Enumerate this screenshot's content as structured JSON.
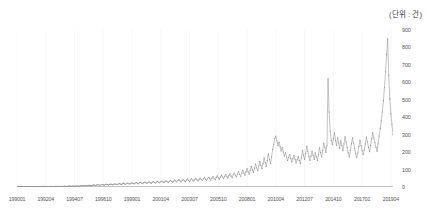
{
  "unit_label": "(단위 : 건)",
  "colors": {
    "line": "#9a9a9a",
    "marker": "#8c8c8c",
    "axis": "#888888",
    "grid": "#f0f0f0",
    "text": "#555555"
  },
  "chart_data": {
    "type": "line",
    "title": "",
    "subtitle": "",
    "xlabel": "",
    "ylabel": "",
    "unit": "(단위 : 건)",
    "ylim": [
      0,
      900
    ],
    "grid": "vertical-only",
    "legend": "none",
    "y_ticks": [
      0,
      100,
      200,
      300,
      400,
      500,
      600,
      700,
      800,
      900
    ],
    "x_tick_labels": [
      "199001",
      "199204",
      "199407",
      "199610",
      "199901",
      "200104",
      "200307",
      "200510",
      "200801",
      "201004",
      "201207",
      "201410",
      "201701",
      "201904"
    ],
    "x_tick_indices": [
      0,
      27,
      54,
      81,
      108,
      135,
      162,
      189,
      216,
      243,
      270,
      297,
      324,
      351
    ],
    "x_label": "Monthly period (YYYYMM)",
    "n_points": 366,
    "values": [
      2,
      2,
      1,
      3,
      2,
      2,
      1,
      2,
      3,
      2,
      2,
      1,
      2,
      3,
      2,
      2,
      3,
      2,
      1,
      2,
      2,
      3,
      2,
      2,
      3,
      4,
      3,
      2,
      3,
      3,
      2,
      3,
      4,
      3,
      2,
      3,
      4,
      3,
      4,
      3,
      2,
      3,
      4,
      3,
      4,
      5,
      4,
      3,
      5,
      6,
      5,
      4,
      6,
      5,
      4,
      6,
      7,
      6,
      5,
      6,
      8,
      7,
      6,
      8,
      9,
      8,
      7,
      9,
      10,
      9,
      8,
      10,
      12,
      10,
      9,
      12,
      13,
      11,
      10,
      13,
      14,
      12,
      11,
      14,
      16,
      14,
      12,
      15,
      17,
      15,
      13,
      16,
      18,
      16,
      14,
      17,
      20,
      17,
      15,
      19,
      21,
      18,
      16,
      20,
      22,
      19,
      17,
      21,
      24,
      21,
      18,
      23,
      26,
      22,
      19,
      24,
      27,
      23,
      20,
      25,
      28,
      24,
      21,
      26,
      30,
      25,
      22,
      28,
      31,
      26,
      23,
      29,
      32,
      27,
      24,
      30,
      34,
      29,
      25,
      31,
      36,
      30,
      26,
      33,
      38,
      32,
      28,
      35,
      40,
      34,
      29,
      37,
      42,
      35,
      30,
      38,
      43,
      36,
      31,
      40,
      45,
      38,
      32,
      41,
      47,
      39,
      34,
      43,
      49,
      41,
      35,
      45,
      52,
      43,
      37,
      47,
      54,
      45,
      38,
      49,
      56,
      47,
      40,
      52,
      60,
      50,
      42,
      55,
      64,
      53,
      45,
      58,
      68,
      57,
      48,
      62,
      72,
      60,
      51,
      66,
      76,
      63,
      54,
      70,
      80,
      67,
      57,
      74,
      88,
      73,
      62,
      80,
      96,
      80,
      68,
      88,
      104,
      87,
      74,
      96,
      118,
      98,
      83,
      108,
      132,
      110,
      93,
      120,
      148,
      123,
      104,
      134,
      168,
      140,
      118,
      152,
      190,
      158,
      134,
      172,
      215,
      245,
      278,
      292,
      265,
      238,
      258,
      232,
      206,
      226,
      200,
      178,
      196,
      172,
      152,
      170,
      188,
      164,
      144,
      162,
      180,
      158,
      138,
      156,
      174,
      152,
      134,
      168,
      210,
      182,
      158,
      192,
      235,
      205,
      176,
      152,
      178,
      206,
      182,
      158,
      196,
      175,
      152,
      186,
      225,
      198,
      172,
      210,
      252,
      228,
      198,
      238,
      620,
      430,
      320,
      268,
      242,
      276,
      310,
      268,
      238,
      282,
      252,
      222,
      266,
      238,
      208,
      248,
      288,
      258,
      226,
      196,
      172,
      210,
      248,
      282,
      252,
      222,
      190,
      168,
      196,
      232,
      268,
      238,
      208,
      186,
      212,
      248,
      286,
      258,
      228,
      202,
      238,
      276,
      312,
      282,
      255,
      228,
      205,
      248,
      292,
      336,
      380,
      430,
      495,
      570,
      660,
      760,
      850,
      640,
      505,
      420,
      360,
      300
    ]
  }
}
